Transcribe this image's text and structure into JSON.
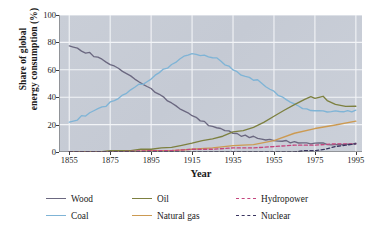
{
  "chart_data": {
    "type": "line",
    "title": "",
    "xlabel": "Year",
    "ylabel_line1": "Share of global",
    "ylabel_line2": "energy consumption (%)",
    "xlim": [
      1850,
      1998
    ],
    "ylim": [
      0,
      100
    ],
    "xticks": [
      1855,
      1875,
      1895,
      1915,
      1935,
      1955,
      1975,
      1995
    ],
    "yticks": [
      0,
      20,
      40,
      60,
      80,
      100
    ],
    "grid": true,
    "legend_position": "below-plot",
    "plot_background": "#c6cbd5",
    "gridline_color": "#f2f4f7",
    "series": [
      {
        "name": "Wood",
        "color": "#6b6880",
        "style": "solid",
        "x": [
          1855,
          1857,
          1859,
          1861,
          1863,
          1865,
          1867,
          1869,
          1871,
          1873,
          1875,
          1877,
          1879,
          1881,
          1883,
          1885,
          1887,
          1889,
          1891,
          1893,
          1895,
          1897,
          1899,
          1901,
          1903,
          1905,
          1907,
          1909,
          1911,
          1913,
          1915,
          1917,
          1919,
          1921,
          1923,
          1925,
          1927,
          1929,
          1931,
          1933,
          1935,
          1937,
          1939,
          1941,
          1943,
          1945,
          1947,
          1949,
          1951,
          1953,
          1955,
          1957,
          1959,
          1961,
          1963,
          1965,
          1967,
          1969,
          1971,
          1973,
          1975,
          1977,
          1979,
          1981,
          1983,
          1985,
          1987,
          1989,
          1991,
          1993,
          1995
        ],
        "values": [
          78,
          77,
          76,
          74,
          73,
          72,
          70,
          69,
          67,
          66,
          64,
          63,
          61,
          59,
          57,
          55,
          53,
          51,
          50,
          48,
          46,
          44,
          42,
          40,
          38,
          36,
          34,
          32,
          30,
          28,
          26,
          25,
          23,
          22,
          20,
          19,
          18,
          17,
          16,
          15,
          14,
          13,
          12,
          12,
          11,
          11,
          10,
          10,
          9,
          9,
          9,
          8,
          8,
          8,
          7,
          7,
          7,
          6,
          6,
          6,
          6,
          6,
          6,
          6,
          6,
          6,
          6,
          6,
          6,
          6,
          6
        ]
      },
      {
        "name": "Coal",
        "color": "#7fb4d6",
        "style": "solid",
        "x": [
          1855,
          1857,
          1859,
          1861,
          1863,
          1865,
          1867,
          1869,
          1871,
          1873,
          1875,
          1877,
          1879,
          1881,
          1883,
          1885,
          1887,
          1889,
          1891,
          1893,
          1895,
          1897,
          1899,
          1901,
          1903,
          1905,
          1907,
          1909,
          1911,
          1913,
          1915,
          1917,
          1919,
          1921,
          1923,
          1925,
          1927,
          1929,
          1931,
          1933,
          1935,
          1937,
          1939,
          1941,
          1943,
          1945,
          1947,
          1949,
          1951,
          1953,
          1955,
          1957,
          1959,
          1961,
          1963,
          1965,
          1967,
          1969,
          1971,
          1973,
          1975,
          1977,
          1979,
          1981,
          1983,
          1985,
          1987,
          1989,
          1991,
          1993,
          1995
        ],
        "values": [
          22,
          23,
          24,
          26,
          27,
          28,
          30,
          31,
          33,
          34,
          36,
          37,
          39,
          41,
          43,
          45,
          47,
          49,
          50,
          52,
          54,
          56,
          58,
          60,
          62,
          64,
          66,
          68,
          70,
          71,
          72,
          72,
          71,
          71,
          70,
          69,
          68,
          66,
          64,
          62,
          60,
          58,
          56,
          55,
          54,
          53,
          52,
          50,
          48,
          46,
          44,
          42,
          40,
          38,
          36,
          35,
          33,
          32,
          31,
          30,
          30,
          30,
          30,
          29,
          29,
          30,
          30,
          30,
          30,
          30,
          30
        ]
      },
      {
        "name": "Oil",
        "color": "#7d8040",
        "style": "solid",
        "x": [
          1855,
          1860,
          1865,
          1870,
          1875,
          1880,
          1885,
          1890,
          1895,
          1900,
          1905,
          1910,
          1915,
          1920,
          1925,
          1930,
          1935,
          1940,
          1945,
          1950,
          1955,
          1960,
          1965,
          1970,
          1973,
          1975,
          1979,
          1981,
          1985,
          1990,
          1995
        ],
        "values": [
          0,
          0,
          0,
          0,
          1,
          1,
          1,
          2,
          2,
          3,
          4,
          5,
          6,
          8,
          10,
          12,
          14,
          16,
          18,
          22,
          26,
          30,
          34,
          38,
          40,
          39,
          40,
          38,
          34,
          33,
          33
        ]
      },
      {
        "name": "Natural gas",
        "color": "#cc9a52",
        "style": "solid",
        "x": [
          1855,
          1865,
          1875,
          1885,
          1895,
          1905,
          1915,
          1925,
          1935,
          1945,
          1955,
          1965,
          1975,
          1985,
          1995
        ],
        "values": [
          0,
          0,
          0,
          0,
          1,
          1,
          2,
          3,
          4,
          6,
          9,
          13,
          17,
          20,
          22
        ]
      },
      {
        "name": "Hydropower",
        "color": "#c4467e",
        "style": "dashed",
        "x": [
          1855,
          1875,
          1895,
          1905,
          1915,
          1925,
          1935,
          1945,
          1955,
          1965,
          1975,
          1985,
          1995
        ],
        "values": [
          0,
          0,
          1,
          1,
          2,
          2,
          3,
          3,
          4,
          5,
          5,
          6,
          6
        ]
      },
      {
        "name": "Nuclear",
        "color": "#3a3560",
        "style": "dashed",
        "x": [
          1855,
          1955,
          1960,
          1965,
          1970,
          1975,
          1980,
          1985,
          1990,
          1995
        ],
        "values": [
          0,
          0,
          0,
          0,
          1,
          1,
          2,
          4,
          5,
          6
        ]
      }
    ]
  },
  "axis": {
    "ytick_labels": [
      "0",
      "20",
      "40",
      "60",
      "80",
      "100"
    ],
    "xtick_labels": [
      "1855",
      "1875",
      "1895",
      "1915",
      "1935",
      "1955",
      "1975",
      "1995"
    ],
    "x_title": "Year",
    "y_title_line1": "Share of global",
    "y_title_line2": "energy consumption (%)"
  },
  "legend": {
    "items": [
      {
        "label": "Wood",
        "color": "#6b6880",
        "style": "solid"
      },
      {
        "label": "Oil",
        "color": "#7d8040",
        "style": "solid"
      },
      {
        "label": "Hydropower",
        "color": "#c4467e",
        "style": "dashed"
      },
      {
        "label": "Coal",
        "color": "#7fb4d6",
        "style": "solid"
      },
      {
        "label": "Natural gas",
        "color": "#cc9a52",
        "style": "solid"
      },
      {
        "label": "Nuclear",
        "color": "#3a3560",
        "style": "dashed"
      }
    ]
  }
}
